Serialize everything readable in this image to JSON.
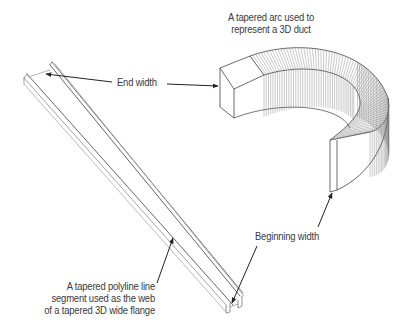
{
  "figure": {
    "background": "#ffffff",
    "line_color": "#333333",
    "light_line_color": "#8a8a8a",
    "text_color": "#3a3a3a"
  },
  "labels": {
    "duct_caption_line1": "A tapered arc used to",
    "duct_caption_line2": "represent a 3D duct",
    "end_width": "End width",
    "beginning_width": "Beginning width",
    "flange_caption_line1": "A tapered polyline line",
    "flange_caption_line2": "segment used as the web",
    "flange_caption_line3": "of a tapered 3D wide flange"
  },
  "objects": [
    {
      "name": "tapered-3d-duct",
      "description": "Tapered arc rendered as a 3D duct, curved segments"
    },
    {
      "name": "tapered-wide-flange",
      "description": "Tapered polyline segment as web of a 3D wide flange"
    }
  ]
}
